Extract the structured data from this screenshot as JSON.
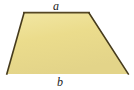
{
  "figure": {
    "type": "geometric-diagram",
    "shape": "trapezoid",
    "background_color": "#ffffff",
    "fill_color": "#ebdc8c",
    "fill_color_highlight": "#f2e7a4",
    "fill_color_shade": "#ded09f",
    "stroke_color": "#5b4b23",
    "stroke_color_dark": "#3f3418",
    "stroke_width": 1.6,
    "vertices": {
      "top_left": [
        24,
        13
      ],
      "top_right": [
        89,
        13
      ],
      "bottom_right": [
        128,
        74
      ],
      "bottom_left": [
        7,
        74
      ]
    },
    "polygon_points": "24,13 89,13 128,74 7,74",
    "labels": {
      "top_side": "a",
      "bottom_side": "b"
    },
    "label_positions": {
      "top_side": [
        57,
        5
      ],
      "bottom_side": [
        61,
        82
      ]
    }
  }
}
